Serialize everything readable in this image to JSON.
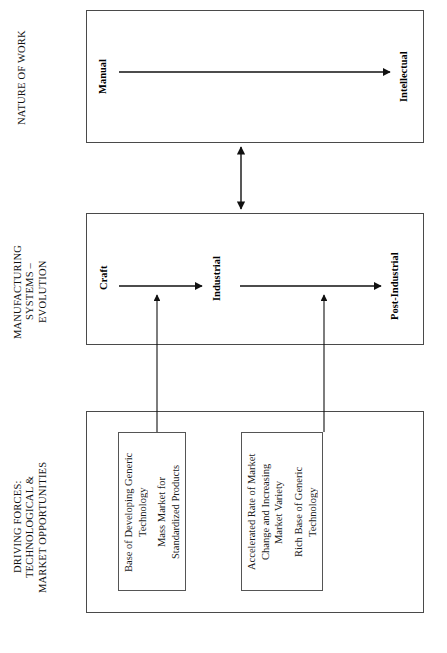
{
  "diagram": {
    "orientation": "rotated-90-ccw",
    "line_color": "#4a4a4a",
    "text_color": "#000000",
    "background": "#ffffff"
  },
  "rows": [
    {
      "id": "nature-of-work",
      "label": "NATURE OF WORK",
      "stages": [
        {
          "id": "manual",
          "label": "Manual"
        },
        {
          "id": "intellectual",
          "label": "Intellectual"
        }
      ]
    },
    {
      "id": "manufacturing-systems",
      "label": "MANUFACTURING\nSYSTEMS –\nEVOLUTION",
      "stages": [
        {
          "id": "craft",
          "label": "Craft"
        },
        {
          "id": "industrial",
          "label": "Industrial"
        },
        {
          "id": "post-industrial",
          "label": "Post-Industrial"
        }
      ]
    },
    {
      "id": "driving-forces",
      "label": "DRIVING FORCES:\nTECHNOLOGICAL &\nMARKET OPPORTUNITIES",
      "boxes": [
        {
          "id": "force-box-1",
          "lines": [
            "Base of Developing Generic\nTechnology",
            "Mass Market for\nStandardized Products"
          ]
        },
        {
          "id": "force-box-2",
          "lines": [
            "Accelerated Rate of Market\nChange and Increasing\nMarket Variety",
            "Rich Base of Generic\nTechnology"
          ]
        }
      ]
    }
  ],
  "connectors": [
    {
      "id": "work-to-systems",
      "type": "double-headed-arrow",
      "from": "nature-of-work",
      "to": "manufacturing-systems"
    },
    {
      "id": "craft-to-industrial",
      "type": "arrow",
      "from": "craft",
      "to": "industrial"
    },
    {
      "id": "industrial-to-post-industrial",
      "type": "arrow",
      "from": "industrial",
      "to": "post-industrial"
    },
    {
      "id": "manual-to-intellectual",
      "type": "arrow",
      "from": "manual",
      "to": "intellectual"
    },
    {
      "id": "force1-to-craft-industrial",
      "type": "arrow",
      "from": "force-box-1",
      "to": "craft-to-industrial"
    },
    {
      "id": "force2-to-industrial-post",
      "type": "arrow",
      "from": "force-box-2",
      "to": "industrial-to-post-industrial"
    }
  ]
}
